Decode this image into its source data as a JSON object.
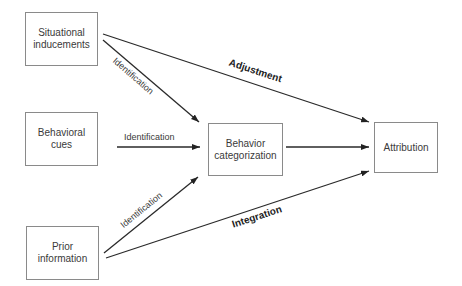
{
  "diagram": {
    "nodes": [
      {
        "id": "situational",
        "lines": [
          "Situational",
          "inducements"
        ]
      },
      {
        "id": "behavioral",
        "lines": [
          "Behavioral",
          "cues"
        ]
      },
      {
        "id": "prior",
        "lines": [
          "Prior",
          "information"
        ]
      },
      {
        "id": "categorization",
        "lines": [
          "Behavior",
          "categorization"
        ]
      },
      {
        "id": "attribution",
        "lines": [
          "Attribution"
        ]
      }
    ],
    "edges": [
      {
        "from": "situational",
        "to": "attribution",
        "label": "Adjustment"
      },
      {
        "from": "situational",
        "to": "categorization",
        "label": "Identification"
      },
      {
        "from": "behavioral",
        "to": "categorization",
        "label": "Identification"
      },
      {
        "from": "prior",
        "to": "categorization",
        "label": "Identification"
      },
      {
        "from": "prior",
        "to": "attribution",
        "label": "Integration"
      },
      {
        "from": "categorization",
        "to": "attribution",
        "label": ""
      }
    ],
    "colors": {
      "line": "#2a2a2a",
      "box_border": "#8a8a8a",
      "text": "#3a3a3a"
    }
  }
}
